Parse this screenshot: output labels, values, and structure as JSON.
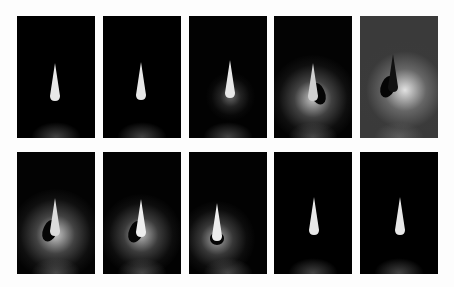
{
  "figure": {
    "rows": 2,
    "cols": 5,
    "panels": [
      {
        "row": 0,
        "col": 0,
        "x": 17,
        "y": 16,
        "glow": 0,
        "bg": "#000000",
        "cone_x": 32,
        "cone_y": 47,
        "cone_color": "#e8e8e8",
        "shadow": "none"
      },
      {
        "row": 0,
        "col": 1,
        "x": 103,
        "y": 16,
        "glow": 0,
        "bg": "#000000",
        "cone_x": 32,
        "cone_y": 46,
        "cone_color": "#e8e8e8",
        "shadow": "none"
      },
      {
        "row": 0,
        "col": 2,
        "x": 189,
        "y": 16,
        "glow": 0.15,
        "bg": "#020202",
        "cone_x": 35,
        "cone_y": 44,
        "cone_color": "#e8e8e8",
        "shadow": "none"
      },
      {
        "row": 0,
        "col": 3,
        "x": 274,
        "y": 16,
        "glow": 0.8,
        "bg": "#030303",
        "cone_x": 33,
        "cone_y": 47,
        "cone_color": "#d0d0d0",
        "shadow": "right"
      },
      {
        "row": 0,
        "col": 4,
        "x": 360,
        "y": 16,
        "glow": 1.0,
        "bg": "#3a3a3a",
        "cone_x": 27,
        "cone_y": 38,
        "cone_color": "#111111",
        "shadow": "left"
      },
      {
        "row": 1,
        "col": 0,
        "x": 17,
        "y": 152,
        "glow": 0.85,
        "bg": "#030303",
        "cone_x": 32,
        "cone_y": 46,
        "cone_color": "#dcdcdc",
        "shadow": "left"
      },
      {
        "row": 1,
        "col": 1,
        "x": 103,
        "y": 152,
        "glow": 0.7,
        "bg": "#020202",
        "cone_x": 32,
        "cone_y": 47,
        "cone_color": "#eeeeee",
        "shadow": "left"
      },
      {
        "row": 1,
        "col": 2,
        "x": 189,
        "y": 152,
        "glow": 0.6,
        "bg": "#020202",
        "cone_x": 22,
        "cone_y": 51,
        "cone_color": "#eeeeee",
        "shadow": "under"
      },
      {
        "row": 1,
        "col": 3,
        "x": 274,
        "y": 152,
        "glow": 0,
        "bg": "#000000",
        "cone_x": 34,
        "cone_y": 45,
        "cone_color": "#e8e8e8",
        "shadow": "none"
      },
      {
        "row": 1,
        "col": 4,
        "x": 360,
        "y": 152,
        "glow": 0,
        "bg": "#000000",
        "cone_x": 34,
        "cone_y": 45,
        "cone_color": "#e8e8e8",
        "shadow": "none"
      }
    ]
  }
}
